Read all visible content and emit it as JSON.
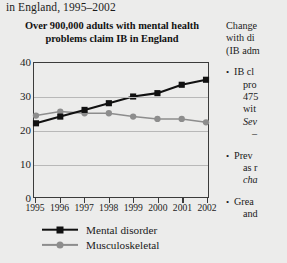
{
  "caption": {
    "continuation_line": "in England, 1995–2002"
  },
  "chart_data": {
    "type": "line",
    "title": "Over 900,000 adults with mental health problems claim IB in England",
    "xlabel": "",
    "ylabel": "",
    "ylim": [
      0,
      40
    ],
    "yticks": [
      0,
      10,
      20,
      30,
      40
    ],
    "grid": true,
    "legend_position": "bottom-left",
    "categories": [
      "1995",
      "1996",
      "1997",
      "1998",
      "1999",
      "2000",
      "2001",
      "2002"
    ],
    "series": [
      {
        "name": "Mental disorder",
        "color": "#111111",
        "marker": "square",
        "values": [
          22,
          24,
          26,
          28,
          30,
          31,
          33.5,
          35
        ]
      },
      {
        "name": "Musculoskeletal",
        "color": "#8d8d8d",
        "marker": "circle",
        "values": [
          24.3,
          25.5,
          25,
          25,
          24,
          23.3,
          23.3,
          22.3
        ]
      }
    ]
  },
  "legend": {
    "items": [
      {
        "label": "Mental disorder",
        "color": "#111111",
        "marker": "square"
      },
      {
        "label": "Musculoskeletal",
        "color": "#8d8d8d",
        "marker": "circle"
      }
    ]
  },
  "right_column": {
    "paragraph_lines": [
      "Change",
      "with di",
      "(IB adm"
    ],
    "bullets": [
      {
        "lines": [
          "IB cl",
          "pro",
          "475",
          "wit",
          "Sev",
          "–"
        ]
      },
      {
        "lines": [
          "Prev",
          "as r",
          "cha"
        ]
      },
      {
        "lines": [
          "Grea",
          "and"
        ]
      }
    ]
  }
}
